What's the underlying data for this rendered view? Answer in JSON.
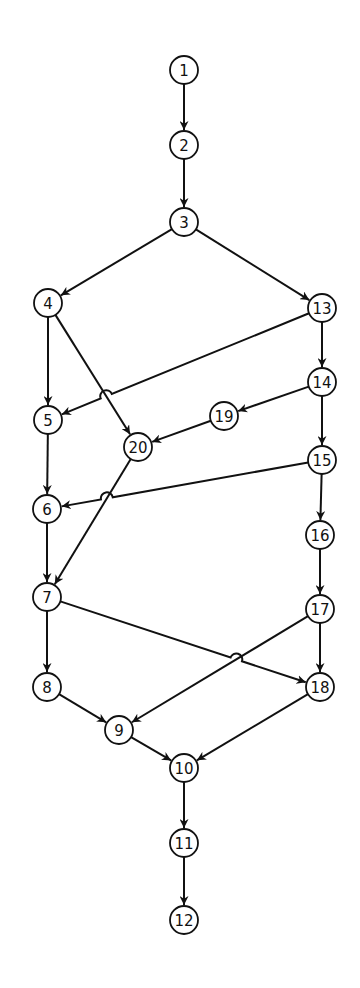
{
  "diagram": {
    "type": "directed-graph",
    "colors": {
      "stroke": "#111111",
      "background": "#ffffff"
    },
    "node_radius": 14,
    "nodes": [
      {
        "id": "1",
        "label": "1",
        "x": 184,
        "y": 70
      },
      {
        "id": "2",
        "label": "2",
        "x": 184,
        "y": 145
      },
      {
        "id": "3",
        "label": "3",
        "x": 184,
        "y": 222
      },
      {
        "id": "4",
        "label": "4",
        "x": 48,
        "y": 303
      },
      {
        "id": "5",
        "label": "5",
        "x": 48,
        "y": 420
      },
      {
        "id": "6",
        "label": "6",
        "x": 47,
        "y": 509
      },
      {
        "id": "7",
        "label": "7",
        "x": 47,
        "y": 597
      },
      {
        "id": "8",
        "label": "8",
        "x": 47,
        "y": 687
      },
      {
        "id": "9",
        "label": "9",
        "x": 119,
        "y": 730
      },
      {
        "id": "10",
        "label": "10",
        "x": 184,
        "y": 768
      },
      {
        "id": "11",
        "label": "11",
        "x": 184,
        "y": 843
      },
      {
        "id": "12",
        "label": "12",
        "x": 184,
        "y": 920
      },
      {
        "id": "13",
        "label": "13",
        "x": 322,
        "y": 308
      },
      {
        "id": "14",
        "label": "14",
        "x": 322,
        "y": 382
      },
      {
        "id": "15",
        "label": "15",
        "x": 322,
        "y": 460
      },
      {
        "id": "16",
        "label": "16",
        "x": 320,
        "y": 535
      },
      {
        "id": "17",
        "label": "17",
        "x": 320,
        "y": 609
      },
      {
        "id": "18",
        "label": "18",
        "x": 320,
        "y": 687
      },
      {
        "id": "19",
        "label": "19",
        "x": 224,
        "y": 416
      },
      {
        "id": "20",
        "label": "20",
        "x": 138,
        "y": 447
      }
    ],
    "edges": [
      {
        "from": "1",
        "to": "2"
      },
      {
        "from": "2",
        "to": "3"
      },
      {
        "from": "3",
        "to": "4"
      },
      {
        "from": "3",
        "to": "13"
      },
      {
        "from": "4",
        "to": "5"
      },
      {
        "from": "4",
        "to": "20"
      },
      {
        "from": "13",
        "to": "14"
      },
      {
        "from": "13",
        "to": "5",
        "hop": true
      },
      {
        "from": "14",
        "to": "19"
      },
      {
        "from": "14",
        "to": "15"
      },
      {
        "from": "19",
        "to": "20"
      },
      {
        "from": "5",
        "to": "6"
      },
      {
        "from": "15",
        "to": "6",
        "hop": true
      },
      {
        "from": "15",
        "to": "16"
      },
      {
        "from": "20",
        "to": "7"
      },
      {
        "from": "6",
        "to": "7"
      },
      {
        "from": "16",
        "to": "17"
      },
      {
        "from": "7",
        "to": "8"
      },
      {
        "from": "7",
        "to": "18",
        "hop": true
      },
      {
        "from": "17",
        "to": "18"
      },
      {
        "from": "17",
        "to": "9"
      },
      {
        "from": "8",
        "to": "9"
      },
      {
        "from": "9",
        "to": "10"
      },
      {
        "from": "18",
        "to": "10"
      },
      {
        "from": "10",
        "to": "11"
      },
      {
        "from": "11",
        "to": "12"
      }
    ]
  }
}
